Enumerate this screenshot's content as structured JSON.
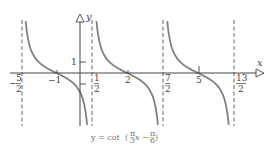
{
  "chart_data": {
    "type": "line",
    "title": "",
    "caption": "y = cot(π/3 x − π/6)",
    "function": "cot(pi/3*x - pi/6)",
    "period": 3,
    "xlabel": "x",
    "ylabel": "y",
    "x_ticks": [
      {
        "value": -2.5,
        "label_num": "5",
        "label_den": "2",
        "sign": "−"
      },
      {
        "value": -1,
        "label": "−1"
      },
      {
        "value": 0.5,
        "label_num": "1",
        "label_den": "2"
      },
      {
        "value": 2,
        "label": "2"
      },
      {
        "value": 3.5,
        "label_num": "7",
        "label_den": "2"
      },
      {
        "value": 5,
        "label": "5"
      },
      {
        "value": 6.5,
        "label_num": "13",
        "label_den": "2"
      }
    ],
    "y_ticks": [
      {
        "value": 1,
        "label": "1"
      },
      {
        "value": -1,
        "label": ""
      }
    ],
    "asymptotes": [
      -2.5,
      0.5,
      3.5,
      6.5
    ],
    "zeros": [
      -1,
      2,
      5
    ],
    "xlim": [
      -3.0,
      7.8
    ],
    "ylim": [
      -5,
      5.5
    ],
    "grid": false,
    "legend": null,
    "colors": {
      "curve": "#808080",
      "axis": "#444444",
      "asymptote": "#555555"
    }
  },
  "labels": {
    "x_axis": "x",
    "y_axis": "y",
    "neg_sign": "−",
    "tick_m1": "−1",
    "tick_2": "2",
    "tick_5": "5",
    "tick_y1": "1",
    "frac_5": "5",
    "frac_1": "1",
    "frac_7": "7",
    "frac_13": "13",
    "den_2": "2",
    "caption_pre": "y = cot",
    "caption_x": "x −",
    "caption_pi": "π",
    "caption_3": "3",
    "caption_6": "6"
  }
}
